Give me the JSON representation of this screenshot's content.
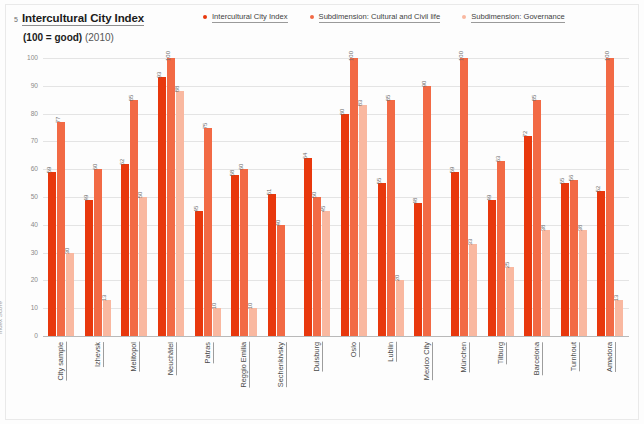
{
  "header": {
    "number": "5",
    "title": "Intercultural City Index",
    "subtitle_strong": "(100 = good)",
    "subtitle_year": "(2010)"
  },
  "legend": {
    "items": [
      {
        "label": "Intercultural City Index",
        "color": "#E8380D"
      },
      {
        "label": "Subdimension: Cultural and Civil life",
        "color": "#F26A45"
      },
      {
        "label": "Subdimension: Governance",
        "color": "#F9B8A0"
      }
    ]
  },
  "axis": {
    "y_title": "Index Score",
    "ticks": [
      "100",
      "90",
      "80",
      "70",
      "60",
      "50",
      "40",
      "30",
      "20",
      "10",
      "0"
    ]
  },
  "chart_data": {
    "type": "bar",
    "title": "Intercultural City Index (100 = good) (2010)",
    "xlabel": "",
    "ylabel": "Index Score",
    "ylim": [
      0,
      100
    ],
    "grid": true,
    "legend_position": "top-right",
    "categories": [
      "City sample",
      "Izhevsk",
      "Melitopol",
      "Neuchâtel",
      "Patras",
      "Reggio Emilia",
      "Sechenkivsky",
      "Duisburg",
      "Oslo",
      "Lublin",
      "Mexico City",
      "München",
      "Tilburg",
      "Barcelona",
      "Turnhout",
      "Amadora"
    ],
    "series": [
      {
        "name": "Intercultural City Index",
        "color": "#E8380D",
        "values": [
          59,
          49,
          62,
          93,
          45,
          58,
          51,
          64,
          80,
          55,
          48,
          59,
          49,
          72,
          55,
          52
        ]
      },
      {
        "name": "Subdimension: Cultural and Civil life",
        "color": "#F26A45",
        "values": [
          77,
          60,
          85,
          100,
          75,
          60,
          40,
          50,
          100,
          85,
          90,
          100,
          63,
          85,
          56,
          100
        ]
      },
      {
        "name": "Subdimension: Governance",
        "color": "#F9B8A0",
        "values": [
          30,
          13,
          50,
          88,
          10,
          10,
          null,
          45,
          83,
          20,
          null,
          33,
          25,
          38,
          38,
          13
        ]
      }
    ]
  }
}
